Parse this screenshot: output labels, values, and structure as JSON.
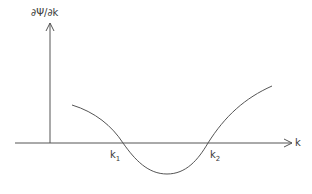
{
  "diagram": {
    "y_axis_label": "∂Ψ/∂k",
    "x_axis_label": "k",
    "points": [
      {
        "base": "k",
        "sub": "1"
      },
      {
        "base": "k",
        "sub": "2"
      }
    ],
    "colors": {
      "line": "#555555",
      "text": "#3a3a3a",
      "background": "#ffffff"
    }
  }
}
